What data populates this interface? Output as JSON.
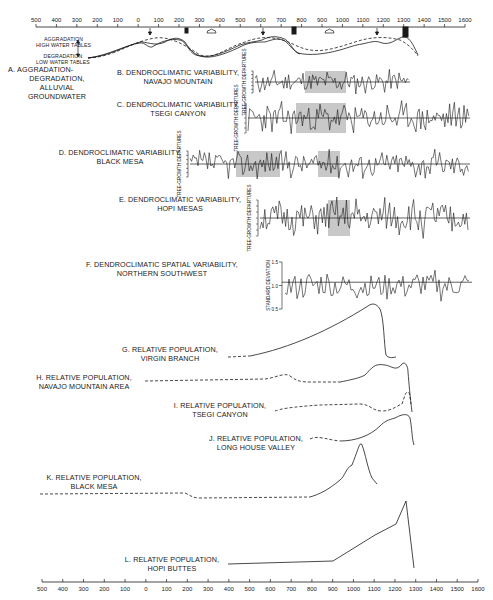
{
  "axis": {
    "ticks": [
      "500",
      "400",
      "300",
      "200",
      "100",
      "0",
      "100",
      "200",
      "300",
      "400",
      "500",
      "600",
      "700",
      "800",
      "900",
      "1000",
      "1100",
      "1200",
      "1300",
      "1400",
      "1500",
      "1600"
    ]
  },
  "panels": {
    "a": {
      "letter": "A.",
      "title_lines": [
        "AGGRADATION-",
        "DEGRADATION,",
        "ALLUVIAL",
        "GROUNDWATER"
      ],
      "high_label": [
        "AGGRADATION",
        "HIGH WATER TABLES"
      ],
      "low_label": [
        "DEGRADATION",
        "LOW WATER TABLES"
      ]
    },
    "b": {
      "letter": "B.",
      "title": "DENDROCLIMATIC VARIABILITY,",
      "subtitle": "NAVAJO MOUNTAIN",
      "ylabel": [
        "TREE-GROWTH",
        "DEPARTURES"
      ]
    },
    "c": {
      "letter": "C.",
      "title": "DENDROCLIMATIC VARIABILITY,",
      "subtitle": "TSEGI CANYON",
      "ylabel": [
        "TREE-GROWTH",
        "DEPARTURES"
      ]
    },
    "d": {
      "letter": "D.",
      "title": "DENDROCLIMATIC VARIABILITY,",
      "subtitle": "BLACK MESA",
      "ylabel": [
        "TREE-GROWTH",
        "DEPARTURES"
      ]
    },
    "e": {
      "letter": "E.",
      "title": "DENDROCLIMATIC VARIABILITY,",
      "subtitle": "HOPI MESAS",
      "ylabel": [
        "TREE-GROWTH",
        "DEPARTURES"
      ]
    },
    "f": {
      "letter": "F.",
      "title": "DENDROCLIMATIC SPATIAL VARIABILITY,",
      "subtitle": "NORTHERN SOUTHWEST",
      "ylabel": [
        "STANDARD",
        "DEVIATION"
      ],
      "yticks": [
        "1.5",
        "1.0",
        "0.5"
      ]
    },
    "g": {
      "letter": "G.",
      "title": "RELATIVE POPULATION,",
      "subtitle": "VIRGIN BRANCH"
    },
    "h": {
      "letter": "H.",
      "title": "RELATIVE POPULATION,",
      "subtitle": "NAVAJO MOUNTAIN AREA"
    },
    "i": {
      "letter": "I.",
      "title": "RELATIVE POPULATION,",
      "subtitle": "TSEGI CANYON"
    },
    "j": {
      "letter": "J.",
      "title": "RELATIVE POPULATION,",
      "subtitle": "LONG HOUSE VALLEY"
    },
    "k": {
      "letter": "K.",
      "title": "RELATIVE POPULATION,",
      "subtitle": "BLACK MESA"
    },
    "l": {
      "letter": "L.",
      "title": "RELATIVE POPULATION,",
      "subtitle": "HOPI BUTTES"
    }
  },
  "dendro_yticks": [
    "+3",
    "+2",
    "+1",
    "0",
    "-1",
    "-2",
    "-3"
  ],
  "colors": {
    "ink": "#1a1a1a",
    "shade": "#c8c8c8",
    "bg": "#ffffff"
  }
}
